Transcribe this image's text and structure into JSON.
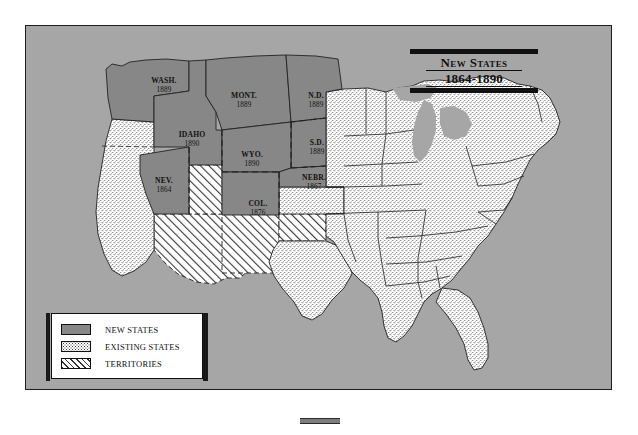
{
  "map": {
    "title_line1": "New States",
    "title_line2": "1864-1890",
    "panel_color": "#a6a6a6",
    "new_state_color": "#878787",
    "existing_state_color": "#ffffff",
    "territory_color": "#ffffff",
    "border_color": "#1d1d1d"
  },
  "legend": {
    "items": [
      {
        "label": "NEW STATES",
        "swatch": "solid-gray"
      },
      {
        "label": "EXISTING STATES",
        "swatch": "stippled"
      },
      {
        "label": "TERRITORIES",
        "swatch": "diagonal-hatch"
      }
    ]
  },
  "new_states": [
    {
      "abbr": "WASH.",
      "year": "1889",
      "x": 138,
      "y": 57
    },
    {
      "abbr": "MONT.",
      "year": "1889",
      "x": 218,
      "y": 72
    },
    {
      "abbr": "N.D.",
      "year": "1889",
      "x": 290,
      "y": 72
    },
    {
      "abbr": "S.D.",
      "year": "1889",
      "x": 291,
      "y": 119
    },
    {
      "abbr": "IDAHO",
      "year": "1890",
      "x": 166,
      "y": 111
    },
    {
      "abbr": "WYO.",
      "year": "1890",
      "x": 226,
      "y": 131
    },
    {
      "abbr": "NEBR.",
      "year": "1867",
      "x": 288,
      "y": 154
    },
    {
      "abbr": "NEV.",
      "year": "1864",
      "x": 138,
      "y": 157
    },
    {
      "abbr": "COL.",
      "year": "1876",
      "x": 232,
      "y": 180
    }
  ]
}
